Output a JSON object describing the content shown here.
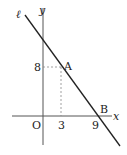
{
  "diagram": {
    "line_label": "ℓ",
    "x_axis_label": "x",
    "y_axis_label": "y",
    "origin_label": "O",
    "point_a_label": "A",
    "point_b_label": "B",
    "tick_x_3": "3",
    "tick_x_9": "9",
    "tick_y_8": "8",
    "points": {
      "A": [
        3,
        8
      ],
      "B": [
        9,
        0
      ]
    },
    "colors": {
      "line": "#222222",
      "axis": "#555555",
      "dashed": "#888888"
    }
  }
}
